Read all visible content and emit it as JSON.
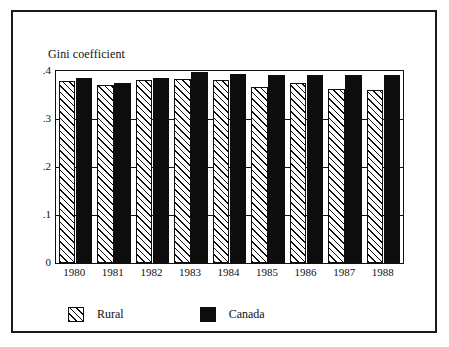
{
  "chart_data": {
    "type": "bar",
    "title": "",
    "ylabel": "Gini coefficient",
    "xlabel": "",
    "categories": [
      "1980",
      "1981",
      "1982",
      "1983",
      "1984",
      "1985",
      "1986",
      "1987",
      "1988"
    ],
    "series": [
      {
        "name": "Rural",
        "values": [
          0.379,
          0.37,
          0.381,
          0.383,
          0.382,
          0.366,
          0.375,
          0.363,
          0.36
        ],
        "fill": "diagonal-hatch",
        "color": "#0d0d0d"
      },
      {
        "name": "Canada",
        "values": [
          0.385,
          0.376,
          0.386,
          0.397,
          0.393,
          0.391,
          0.391,
          0.391,
          0.391
        ],
        "fill": "solid",
        "color": "#0d0d0d"
      }
    ],
    "ylim": [
      0,
      0.4
    ],
    "yticks": [
      "0",
      ".1",
      ".2",
      ".3",
      ".4"
    ],
    "ytick_values": [
      0,
      0.1,
      0.2,
      0.3,
      0.4
    ],
    "grid": true,
    "legend_position": "bottom-left"
  },
  "legend": {
    "entries": [
      {
        "label": "Rural"
      },
      {
        "label": "Canada"
      }
    ]
  }
}
